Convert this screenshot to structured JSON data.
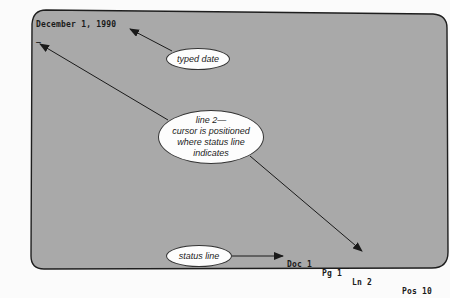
{
  "screen": {
    "background_color": "#a9a9a9",
    "border_color": "#1e1e1e",
    "document": {
      "line1": "December 1, 1990",
      "cursor": "_"
    },
    "status_bar": {
      "doc": "Doc 1",
      "page": "Pg 1",
      "line": "Ln 2",
      "position": "Pos 10"
    }
  },
  "callouts": {
    "typed_date": "typed date",
    "line2": {
      "line_a": "line 2—",
      "line_b": "cursor is positioned",
      "line_c": "where status line",
      "line_d": "indicates"
    },
    "status_line": "status line"
  }
}
